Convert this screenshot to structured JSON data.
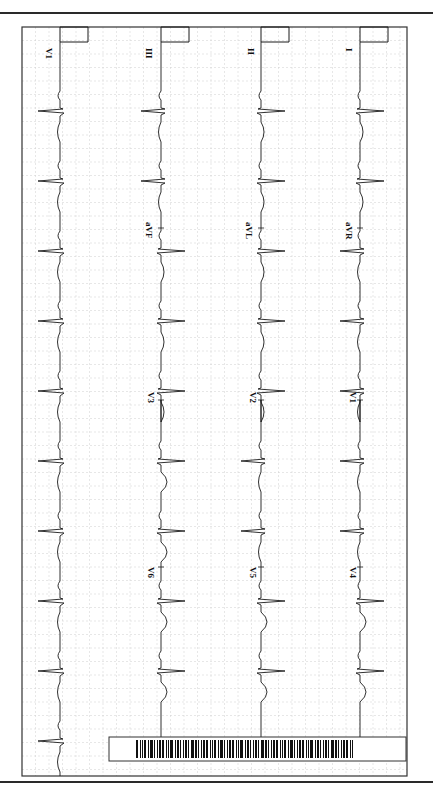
{
  "document": {
    "type": "12-lead ECG printout (rotated 90°)",
    "orientation": "time runs top-to-bottom"
  },
  "colors": {
    "grid": "#cfcfcf",
    "grid_major": "#bdbdbd",
    "trace": "#1a1a1a",
    "frame": "#333333",
    "rule": "#2a2a2a"
  },
  "frame": {
    "x": 22,
    "y": 27,
    "width": 385,
    "height": 749
  },
  "grid": {
    "spacing": 13.5
  },
  "lanes": [
    {
      "name": "lane-rhythm",
      "baseline_x": 60,
      "calibration": true,
      "segments": [
        {
          "label": "V1",
          "y_start": 42,
          "y_end": 776
        }
      ]
    },
    {
      "name": "lane-3",
      "baseline_x": 161,
      "calibration": true,
      "segments": [
        {
          "label": "III",
          "y_start": 42,
          "y_end": 228
        },
        {
          "label": "aVF",
          "y_start": 228,
          "y_end": 400
        },
        {
          "label": "V3",
          "y_start": 400,
          "y_end": 567
        },
        {
          "label": "V6",
          "y_start": 567,
          "y_end": 737
        }
      ]
    },
    {
      "name": "lane-2",
      "baseline_x": 261,
      "calibration": true,
      "segments": [
        {
          "label": "II",
          "y_start": 42,
          "y_end": 228
        },
        {
          "label": "aVL",
          "y_start": 228,
          "y_end": 400
        },
        {
          "label": "V2",
          "y_start": 400,
          "y_end": 567
        },
        {
          "label": "V5",
          "y_start": 567,
          "y_end": 737
        }
      ]
    },
    {
      "name": "lane-1",
      "baseline_x": 360,
      "calibration": true,
      "segments": [
        {
          "label": "I",
          "y_start": 42,
          "y_end": 228
        },
        {
          "label": "aVR",
          "y_start": 228,
          "y_end": 400
        },
        {
          "label": "V1",
          "y_start": 400,
          "y_end": 567
        },
        {
          "label": "V4",
          "y_start": 567,
          "y_end": 737
        }
      ]
    }
  ],
  "labels": [
    {
      "text": "V1",
      "x": 46,
      "y": 48
    },
    {
      "text": "III",
      "x": 146,
      "y": 48
    },
    {
      "text": "II",
      "x": 248,
      "y": 48
    },
    {
      "text": "I",
      "x": 346,
      "y": 48
    },
    {
      "text": "aVF",
      "x": 146,
      "y": 222
    },
    {
      "text": "aVL",
      "x": 246,
      "y": 222
    },
    {
      "text": "aVR",
      "x": 346,
      "y": 222
    },
    {
      "text": "V3",
      "x": 148,
      "y": 392
    },
    {
      "text": "V2",
      "x": 250,
      "y": 392
    },
    {
      "text": "V1",
      "x": 350,
      "y": 392
    },
    {
      "text": "V6",
      "x": 148,
      "y": 567
    },
    {
      "text": "V5",
      "x": 250,
      "y": 567
    },
    {
      "text": "V4",
      "x": 350,
      "y": 567
    }
  ],
  "beats_y": [
    110,
    180,
    250,
    320,
    390,
    460,
    530,
    600,
    670,
    740
  ],
  "barcode": {
    "x": 109,
    "y": 737,
    "width": 297,
    "height": 24,
    "bars_x_start": 136,
    "bars_x_end": 354
  }
}
